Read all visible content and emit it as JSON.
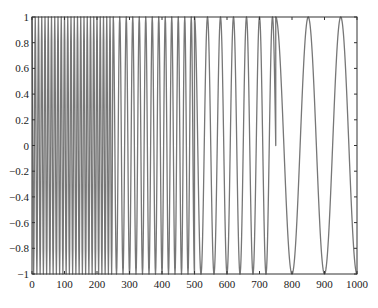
{
  "chart_data": {
    "type": "line",
    "title": "",
    "xlabel": "",
    "ylabel": "",
    "xlim": [
      0,
      1000
    ],
    "ylim": [
      -1,
      1
    ],
    "grid": false,
    "legend": null,
    "x_ticks": [
      0,
      100,
      200,
      300,
      400,
      500,
      600,
      700,
      800,
      900,
      1000
    ],
    "y_ticks": [
      -1,
      -0.8,
      -0.6,
      -0.4,
      -0.2,
      0,
      0.2,
      0.4,
      0.6,
      0.8,
      1
    ],
    "x_tick_labels": [
      "0",
      "100",
      "200",
      "300",
      "400",
      "500",
      "600",
      "700",
      "800",
      "900",
      "1000"
    ],
    "y_tick_labels": [
      "-1",
      "-0.8",
      "-0.6",
      "-0.4",
      "-0.2",
      "0",
      "0.2",
      "0.4",
      "0.6",
      "0.8",
      "1"
    ],
    "series": [
      {
        "name": "stepped-frequency sinusoid",
        "description": "Unit-amplitude cosine whose frequency halves at each 250-sample segment",
        "segments": [
          {
            "x_start": 0,
            "x_end": 250,
            "period": 10,
            "amplitude": 1
          },
          {
            "x_start": 250,
            "x_end": 500,
            "period": 20,
            "amplitude": 1
          },
          {
            "x_start": 500,
            "x_end": 750,
            "period": 40,
            "amplitude": 1
          },
          {
            "x_start": 750,
            "x_end": 1000,
            "period": 100,
            "amplitude": 1
          }
        ],
        "sample_step": 1,
        "color": "#777777"
      }
    ],
    "frame_color": "#333333"
  }
}
